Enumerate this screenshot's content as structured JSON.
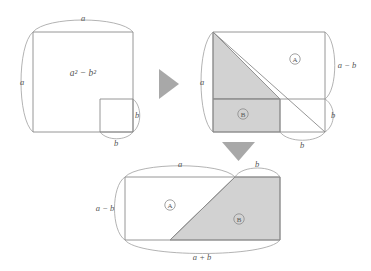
{
  "figure": {
    "colors": {
      "shaded_fill": "#d2d2d2",
      "outline": "#8a8a8a",
      "brace": "#9a9a9a",
      "arrow": "#a8a8a8",
      "label_text": "#555555",
      "background": "#ffffff"
    }
  },
  "step1": {
    "name": "square-with-notch",
    "area_label": "a² − b²",
    "brace_top_label": "a",
    "brace_left_label": "a",
    "brace_small_right_label": "b",
    "brace_small_bottom_label": "b"
  },
  "arrow_right": {
    "name": "arrow-right",
    "glyph": "▶"
  },
  "step2": {
    "name": "square-cut-into-pieces",
    "piece_a_label": "A",
    "piece_b_label": "B",
    "brace_left_label": "a",
    "brace_right_upper_label": "a − b",
    "brace_right_lower_label": "b",
    "brace_bottom_label": "b"
  },
  "arrow_down": {
    "name": "arrow-down",
    "glyph": "▼"
  },
  "step3": {
    "name": "rearranged-rectangle",
    "piece_a_label": "A",
    "piece_b_label": "B",
    "brace_top_left_label": "a",
    "brace_top_right_label": "b",
    "brace_left_label": "a − b",
    "brace_bottom_label": "a + b"
  }
}
